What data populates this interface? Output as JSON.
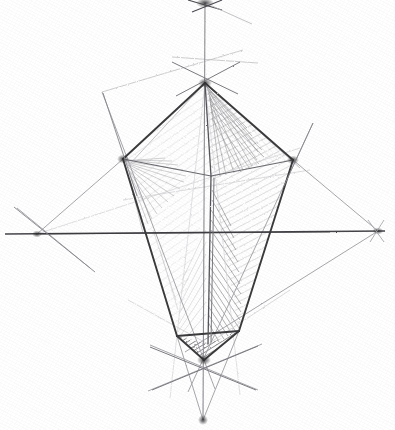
{
  "artwork": {
    "title": "Pencil construction sketch of a kite-shaped polyhedron",
    "medium": "graphite pencil on white paper",
    "background_color": "#ffffff",
    "graphite_color": "#3a3a3c",
    "light_graphite_color": "#9a9a9e",
    "faint_graphite_color": "#c9c9cd",
    "canvas": {
      "width": 395,
      "height": 430
    }
  },
  "geometry": {
    "vertices": {
      "top_apex": {
        "name": "top-apex",
        "x": 205,
        "y": 83
      },
      "left_vertex": {
        "name": "left-vertex",
        "x": 123,
        "y": 159
      },
      "right_vertex": {
        "name": "right-vertex",
        "x": 293,
        "y": 160
      },
      "bottom_apex": {
        "name": "bottom-apex",
        "x": 204,
        "y": 360
      },
      "base_left": {
        "name": "base-left-corner",
        "x": 177,
        "y": 336
      },
      "base_right": {
        "name": "base-right-corner",
        "x": 239,
        "y": 331
      },
      "mid_front": {
        "name": "front-edge-mid",
        "x": 211,
        "y": 176
      },
      "far_top_point": {
        "name": "upper-vanishing-point",
        "x": 205,
        "y": 3
      },
      "far_bottom_point": {
        "name": "lower-vanishing-point",
        "x": 203,
        "y": 420
      },
      "left_axis_point": {
        "name": "left-vanishing-point",
        "x": 37,
        "y": 234
      },
      "right_axis_point": {
        "name": "right-vanishing-point",
        "x": 378,
        "y": 231
      }
    },
    "solid_edges": [
      {
        "name": "edge-top-apex-to-left-vertex",
        "from": [
          205,
          83
        ],
        "to": [
          123,
          159
        ]
      },
      {
        "name": "edge-top-apex-to-right-vertex",
        "from": [
          205,
          83
        ],
        "to": [
          293,
          160
        ]
      },
      {
        "name": "edge-top-apex-to-front-mid",
        "from": [
          205,
          83
        ],
        "to": [
          211,
          176
        ]
      },
      {
        "name": "edge-left-vertex-to-base-left",
        "from": [
          123,
          159
        ],
        "to": [
          177,
          336
        ]
      },
      {
        "name": "edge-right-vertex-to-base-right",
        "from": [
          293,
          160
        ],
        "to": [
          239,
          331
        ]
      },
      {
        "name": "edge-base-left-to-bottom-apex",
        "from": [
          177,
          336
        ],
        "to": [
          204,
          360
        ]
      },
      {
        "name": "edge-base-right-to-bottom-apex",
        "from": [
          239,
          331
        ],
        "to": [
          204,
          360
        ]
      },
      {
        "name": "edge-base-left-to-base-right",
        "from": [
          177,
          336
        ],
        "to": [
          239,
          331
        ]
      },
      {
        "name": "edge-front-vertical",
        "from": [
          211,
          176
        ],
        "to": [
          208,
          344
        ]
      },
      {
        "name": "edge-left-vertex-to-front-mid",
        "from": [
          123,
          159
        ],
        "to": [
          211,
          176
        ]
      },
      {
        "name": "edge-right-vertex-to-front-mid",
        "from": [
          293,
          160
        ],
        "to": [
          211,
          176
        ]
      }
    ],
    "axis_lines": [
      {
        "name": "horizontal-axis",
        "from": [
          5,
          234
        ],
        "to": [
          385,
          231
        ]
      },
      {
        "name": "vertical-axis",
        "from": [
          205,
          3
        ],
        "to": [
          203,
          420
        ]
      }
    ],
    "construction_lines": [
      {
        "name": "construction-upper-left-tick",
        "from": [
          102,
          92
        ],
        "to": [
          243,
          50
        ]
      },
      {
        "name": "construction-upper-right-tick",
        "from": [
          172,
          57
        ],
        "to": [
          258,
          63
        ]
      },
      {
        "name": "construction-left-diagonal",
        "from": [
          102,
          92
        ],
        "to": [
          215,
          389
        ]
      },
      {
        "name": "construction-right-diagonal",
        "from": [
          313,
          123
        ],
        "to": [
          188,
          392
        ]
      },
      {
        "name": "construction-left-axis-cross",
        "from": [
          17,
          208
        ],
        "to": [
          90,
          268
        ]
      },
      {
        "name": "construction-right-vp-to-right-vertex",
        "from": [
          378,
          231
        ],
        "to": [
          293,
          160
        ]
      },
      {
        "name": "construction-right-vp-to-base",
        "from": [
          378,
          231
        ],
        "to": [
          185,
          352
        ]
      },
      {
        "name": "construction-left-vp-to-left-vertex",
        "from": [
          37,
          234
        ],
        "to": [
          123,
          159
        ]
      },
      {
        "name": "construction-left-vp-long",
        "from": [
          37,
          234
        ],
        "to": [
          300,
          148
        ]
      },
      {
        "name": "construction-bottom-x-left",
        "from": [
          148,
          391
        ],
        "to": [
          262,
          344
        ]
      },
      {
        "name": "construction-bottom-x-right",
        "from": [
          258,
          390
        ],
        "to": [
          150,
          345
        ]
      },
      {
        "name": "construction-to-lower-vp-left",
        "from": [
          177,
          336
        ],
        "to": [
          203,
          420
        ]
      },
      {
        "name": "construction-to-lower-vp-right",
        "from": [
          239,
          331
        ],
        "to": [
          203,
          420
        ]
      },
      {
        "name": "construction-base-plane-left",
        "from": [
          128,
          300
        ],
        "to": [
          208,
          344
        ]
      },
      {
        "name": "construction-base-plane-right",
        "from": [
          290,
          290
        ],
        "to": [
          208,
          344
        ]
      },
      {
        "name": "construction-mid-horizontal-faint",
        "from": [
          123,
          200
        ],
        "to": [
          310,
          170
        ]
      },
      {
        "name": "construction-top-apex-down-left",
        "from": [
          205,
          83
        ],
        "to": [
          170,
          398
        ]
      },
      {
        "name": "construction-top-apex-down-right",
        "from": [
          205,
          83
        ],
        "to": [
          240,
          395
        ]
      }
    ],
    "shaded_faces": [
      {
        "name": "face-upper-right-hatch",
        "points": "205,83 293,160 211,176",
        "shade": "medium"
      },
      {
        "name": "face-left-upper-hatch",
        "points": "123,159 205,83 211,176",
        "shade": "light"
      },
      {
        "name": "face-left-lower-hatch",
        "points": "123,159 211,176 177,336",
        "shade": "light"
      },
      {
        "name": "face-right-lower-hatch",
        "points": "211,176 293,160 239,331",
        "shade": "medium"
      },
      {
        "name": "face-bottom-dark",
        "points": "208,344 239,331 204,360 177,336",
        "shade": "dark"
      }
    ]
  },
  "labels": {
    "none_visible": ""
  }
}
